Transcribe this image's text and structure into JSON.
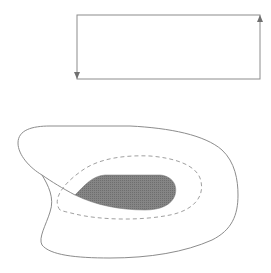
{
  "diagram": {
    "background": "#ffffff",
    "stroke_color": "#888888",
    "dashed_color": "#a0a0a0",
    "fill_color": "#7a7a7a",
    "rectangle": {
      "x": 77,
      "y": 15,
      "width": 183,
      "height": 64,
      "arrows": [
        {
          "edge": "left",
          "direction": "down",
          "position": "bottom"
        },
        {
          "edge": "right",
          "direction": "up",
          "position": "top"
        }
      ]
    },
    "regions": [
      {
        "name": "outer-boundary",
        "style": "solid"
      },
      {
        "name": "middle-boundary",
        "style": "dashed"
      },
      {
        "name": "inner-region",
        "style": "filled"
      }
    ]
  }
}
